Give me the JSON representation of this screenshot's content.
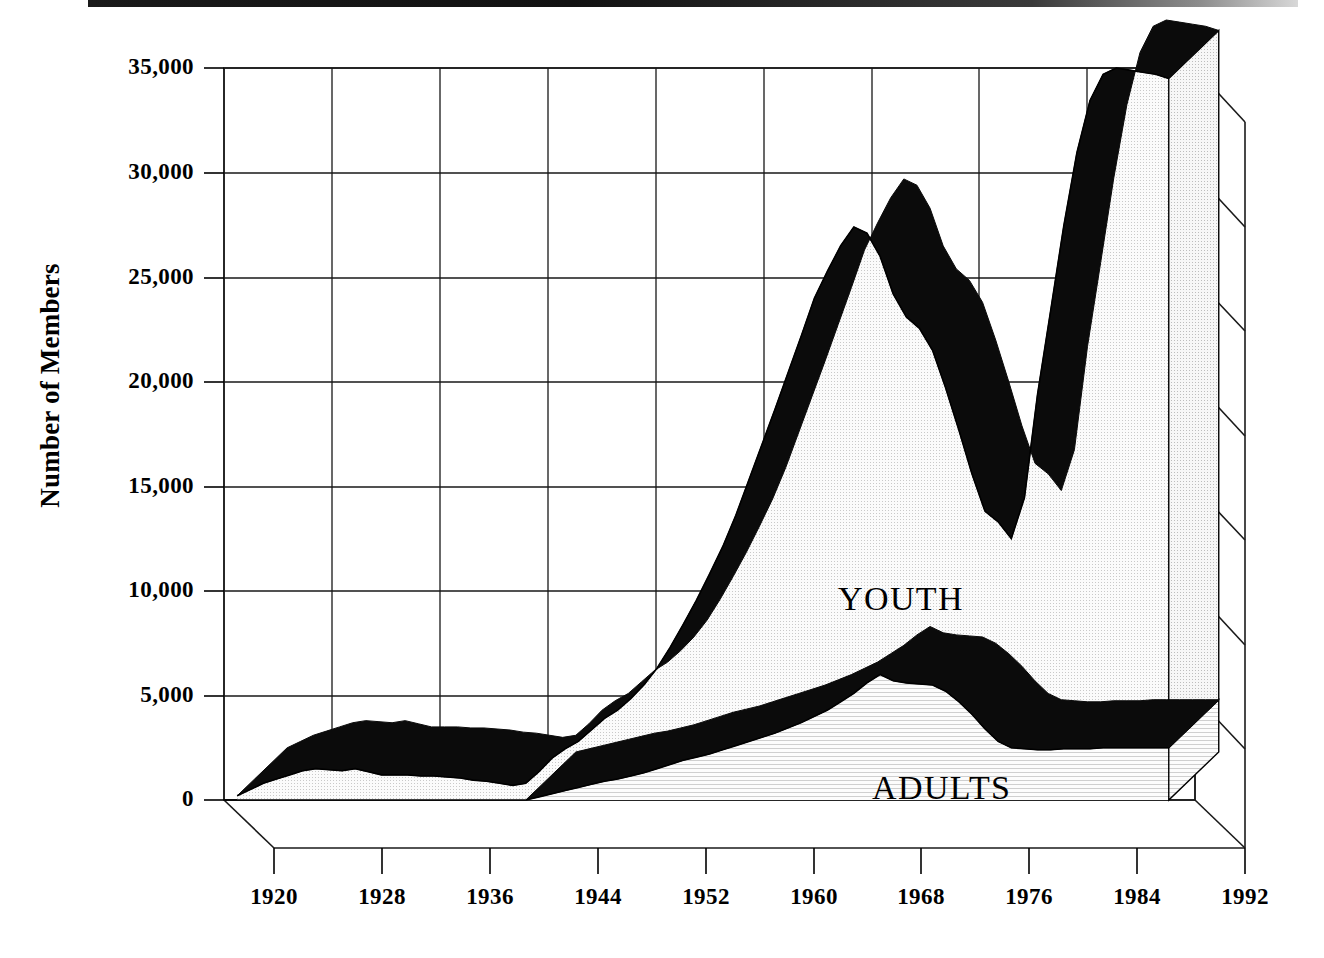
{
  "chart_data": {
    "type": "area",
    "subtype": "stacked-area-3d",
    "title": "",
    "xlabel": "",
    "ylabel": "Number of Members",
    "xlim": [
      1918,
      1992
    ],
    "ylim": [
      0,
      35000
    ],
    "grid": true,
    "legend_position": "inline-on-series",
    "x_tick_labels": [
      "1920",
      "1928",
      "1936",
      "1944",
      "1952",
      "1960",
      "1968",
      "1976",
      "1984",
      "1992"
    ],
    "y_tick_labels": [
      "0",
      "5,000",
      "10,000",
      "15,000",
      "20,000",
      "25,000",
      "30,000",
      "35,000"
    ],
    "y_tick_values": [
      0,
      5000,
      10000,
      15000,
      20000,
      25000,
      30000,
      35000
    ],
    "series": [
      {
        "name": "ADULTS",
        "inline_label": "ADULTS",
        "fill": "#f0f0f0",
        "edge": "#000000",
        "x": [
          1941,
          1942,
          1943,
          1944,
          1945,
          1946,
          1947,
          1948,
          1949,
          1950,
          1951,
          1952,
          1953,
          1954,
          1955,
          1956,
          1957,
          1958,
          1959,
          1960,
          1961,
          1962,
          1963,
          1964,
          1965,
          1966,
          1967,
          1968,
          1969,
          1970,
          1971,
          1972,
          1973,
          1974,
          1975,
          1976,
          1977,
          1978,
          1979,
          1980,
          1981,
          1982,
          1983,
          1984,
          1985,
          1986,
          1987,
          1988,
          1989,
          1990
        ],
        "values": [
          0,
          150,
          300,
          450,
          600,
          750,
          900,
          1000,
          1150,
          1300,
          1500,
          1700,
          1900,
          2050,
          2200,
          2400,
          2600,
          2800,
          3000,
          3200,
          3450,
          3700,
          4000,
          4300,
          4700,
          5100,
          5600,
          6000,
          5700,
          5600,
          5550,
          5500,
          5200,
          4700,
          4100,
          3400,
          2800,
          2500,
          2450,
          2400,
          2400,
          2450,
          2450,
          2450,
          2500,
          2500,
          2500,
          2500,
          2500,
          2500
        ]
      },
      {
        "name": "YOUTH",
        "inline_label": "YOUTH",
        "fill": "#e9e9e9",
        "edge": "#000000",
        "x": [
          1919,
          1920,
          1921,
          1922,
          1923,
          1924,
          1925,
          1926,
          1927,
          1928,
          1929,
          1930,
          1931,
          1932,
          1933,
          1934,
          1935,
          1936,
          1937,
          1938,
          1939,
          1940,
          1941,
          1942,
          1943,
          1944,
          1945,
          1946,
          1947,
          1948,
          1949,
          1950,
          1951,
          1952,
          1953,
          1954,
          1955,
          1956,
          1957,
          1958,
          1959,
          1960,
          1961,
          1962,
          1963,
          1964,
          1965,
          1966,
          1967,
          1968,
          1969,
          1970,
          1971,
          1972,
          1973,
          1974,
          1975,
          1976,
          1977,
          1978,
          1979,
          1980,
          1981,
          1982,
          1983,
          1984,
          1985,
          1986,
          1987,
          1988,
          1989,
          1990
        ],
        "values": [
          200,
          500,
          800,
          1000,
          1200,
          1400,
          1500,
          1450,
          1400,
          1500,
          1350,
          1200,
          1200,
          1200,
          1150,
          1150,
          1100,
          1050,
          950,
          900,
          800,
          700,
          800,
          1200,
          1700,
          2000,
          2200,
          2600,
          3000,
          3300,
          3700,
          4200,
          4800,
          5600,
          6500,
          7500,
          8600,
          9700,
          11000,
          12500,
          14000,
          15500,
          17000,
          18500,
          20000,
          21000,
          21800,
          22300,
          21500,
          20000,
          18500,
          17500,
          17000,
          16000,
          14500,
          13000,
          11500,
          10400,
          10500,
          10000,
          12000,
          17000,
          21000,
          25000,
          28500,
          31000,
          32200,
          32500,
          32400,
          32300,
          32200,
          32000
        ]
      }
    ]
  },
  "axis": {
    "y_title": "Number of Members"
  },
  "labels": {
    "youth": "YOUTH",
    "adults": "ADULTS"
  },
  "colors": {
    "ink": "#000000",
    "youth_fill": "#e9e9e9",
    "adults_fill": "#f2f2f2",
    "grid": "#111111",
    "background": "#ffffff"
  }
}
